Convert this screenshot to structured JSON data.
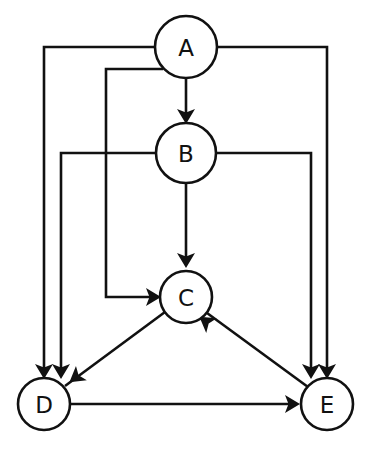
{
  "diagram": {
    "type": "directed-graph",
    "canvas": {
      "width": 371,
      "height": 457,
      "background": "#ffffff"
    },
    "style": {
      "stroke_color": "#111111",
      "node_fill": "#ffffff",
      "stroke_width": 2.6,
      "label_font_size": 23
    },
    "nodes": [
      {
        "id": "A",
        "label": "A",
        "cx": 186,
        "cy": 47,
        "r": 31
      },
      {
        "id": "B",
        "label": "B",
        "cx": 186,
        "cy": 153,
        "r": 30
      },
      {
        "id": "C",
        "label": "C",
        "cx": 186,
        "cy": 297,
        "r": 26
      },
      {
        "id": "D",
        "label": "D",
        "cx": 44,
        "cy": 404,
        "r": 26
      },
      {
        "id": "E",
        "label": "E",
        "cx": 327,
        "cy": 404,
        "r": 26
      }
    ],
    "edges": [
      {
        "id": "a-b",
        "from": "A",
        "to": "B",
        "label": "A → B",
        "routing": "straight-vertical",
        "path": "M 186 78 L 186 116"
      },
      {
        "id": "a-c",
        "from": "A",
        "to": "C",
        "label": "A → C",
        "routing": "orthogonal-left",
        "path": "M 163 69 L 106 69 L 106 297 L 152 297"
      },
      {
        "id": "a-d",
        "from": "A",
        "to": "D",
        "label": "A → D",
        "routing": "orthogonal-left",
        "path": "M 157 47 L 44 47 L 44 370"
      },
      {
        "id": "a-e",
        "from": "A",
        "to": "E",
        "label": "A → E",
        "routing": "orthogonal-right",
        "path": "M 217 47 L 327 47 L 327 370"
      },
      {
        "id": "b-c",
        "from": "B",
        "to": "C",
        "label": "B → C",
        "routing": "straight-vertical",
        "path": "M 186 183 L 186 260"
      },
      {
        "id": "b-d",
        "from": "B",
        "to": "D",
        "label": "B → D",
        "routing": "orthogonal-left",
        "path": "M 156 153 L 61 153 L 61 370"
      },
      {
        "id": "b-e",
        "from": "B",
        "to": "E",
        "label": "B → E",
        "routing": "orthogonal-right",
        "path": "M 216 153 L 311 153 L 311 370"
      },
      {
        "id": "c-d",
        "from": "C",
        "to": "D",
        "label": "C → D",
        "routing": "diagonal",
        "path": "M 165 312 L 65 386"
      },
      {
        "id": "e-c",
        "from": "E",
        "to": "C",
        "label": "E → C",
        "routing": "diagonal",
        "path": "M 308 387 L 207 313"
      },
      {
        "id": "d-e",
        "from": "D",
        "to": "E",
        "label": "D → E",
        "routing": "straight-horizontal",
        "path": "M 70 404 L 292 404"
      }
    ],
    "arrow_heads": [
      {
        "id": "head-a-b",
        "edge": "a-b",
        "x": 186,
        "y": 122,
        "angle": 90
      },
      {
        "id": "head-a-c",
        "edge": "a-c",
        "x": 159,
        "y": 297,
        "angle": 0
      },
      {
        "id": "head-a-d",
        "edge": "a-d",
        "x": 44,
        "y": 377,
        "angle": 90
      },
      {
        "id": "head-a-e",
        "edge": "a-e",
        "x": 327,
        "y": 377,
        "angle": 90
      },
      {
        "id": "head-b-c",
        "edge": "b-c",
        "x": 186,
        "y": 266,
        "angle": 90
      },
      {
        "id": "head-b-d",
        "edge": "b-d",
        "x": 61,
        "y": 377,
        "angle": 90
      },
      {
        "id": "head-b-e",
        "edge": "b-e",
        "x": 311,
        "y": 377,
        "angle": 90
      },
      {
        "id": "head-c-d",
        "edge": "c-d",
        "x": 71,
        "y": 381,
        "angle": 143
      },
      {
        "id": "head-e-c",
        "edge": "e-c",
        "x": 201,
        "y": 318,
        "angle": 216
      },
      {
        "id": "head-d-e",
        "edge": "d-e",
        "x": 298,
        "y": 404,
        "angle": 0
      }
    ]
  }
}
